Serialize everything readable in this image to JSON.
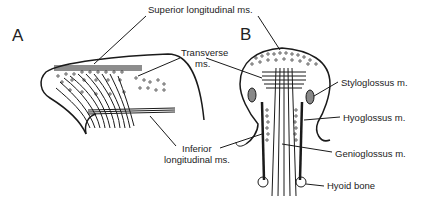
{
  "panels": [
    {
      "id": "A",
      "label": "A"
    },
    {
      "id": "B",
      "label": "B"
    }
  ],
  "labels": {
    "superior_longitudinal": "Superior longitudinal ms.",
    "transverse_line1": "Transverse",
    "transverse_line2": "ms.",
    "inferior_line1": "Inferior",
    "inferior_line2": "longitudinal ms.",
    "styloglossus": "Styloglossus m.",
    "hyoglossus": "Hyoglossus m.",
    "genioglossus": "Genioglossus m.",
    "hyoid": "Hyoid bone"
  },
  "colors": {
    "line": "#1a1a1a",
    "background": "#ffffff"
  }
}
